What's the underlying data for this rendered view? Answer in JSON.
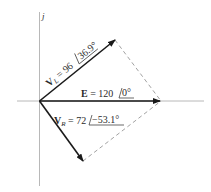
{
  "diagram": {
    "type": "phasor",
    "axis_label_imag": "j",
    "colors": {
      "axis": "#b8b8b8",
      "vector": "#1a1a1a",
      "dashed": "#8a8a8a",
      "text": "#2a2a2a"
    },
    "phasors": [
      {
        "name": "V_L",
        "symbol": "V",
        "subscript": "L",
        "magnitude": "96",
        "angle": "36.9°",
        "label_eq": " = 96 ",
        "angle_text": "36.9°"
      },
      {
        "name": "E",
        "symbol": "E",
        "subscript": "",
        "magnitude": "120",
        "angle": "0°",
        "label_eq": " = 120 ",
        "angle_text": "0°"
      },
      {
        "name": "V_R",
        "symbol": "V",
        "subscript": "R",
        "magnitude": "72",
        "angle": "−53.1°",
        "label_eq": " = 72 ",
        "angle_text": "−53.1°"
      }
    ]
  }
}
